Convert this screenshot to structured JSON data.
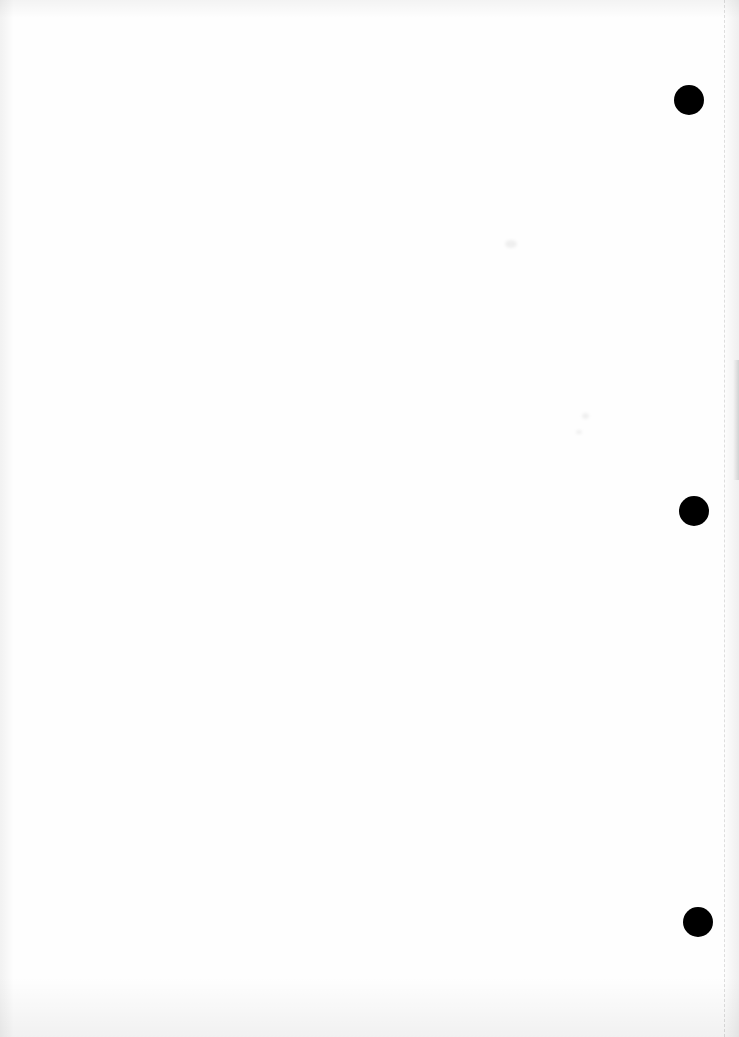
{
  "document": {
    "type": "blank scanned sheet",
    "width": 739,
    "height": 1037,
    "paper_color": "#fefefe",
    "text_content": []
  },
  "punch_holes": [
    {
      "cx": 689,
      "cy": 100,
      "r": 15,
      "color": "#000000"
    },
    {
      "cx": 694,
      "cy": 511,
      "r": 15,
      "color": "#000000"
    },
    {
      "cx": 698,
      "cy": 922,
      "r": 15,
      "color": "#000000"
    }
  ],
  "fold_line": {
    "x": 724
  },
  "smudges": [
    {
      "x": 505,
      "y": 240,
      "w": 12,
      "h": 8
    },
    {
      "x": 582,
      "y": 413,
      "w": 7,
      "h": 6
    },
    {
      "x": 576,
      "y": 430,
      "w": 6,
      "h": 4
    }
  ]
}
